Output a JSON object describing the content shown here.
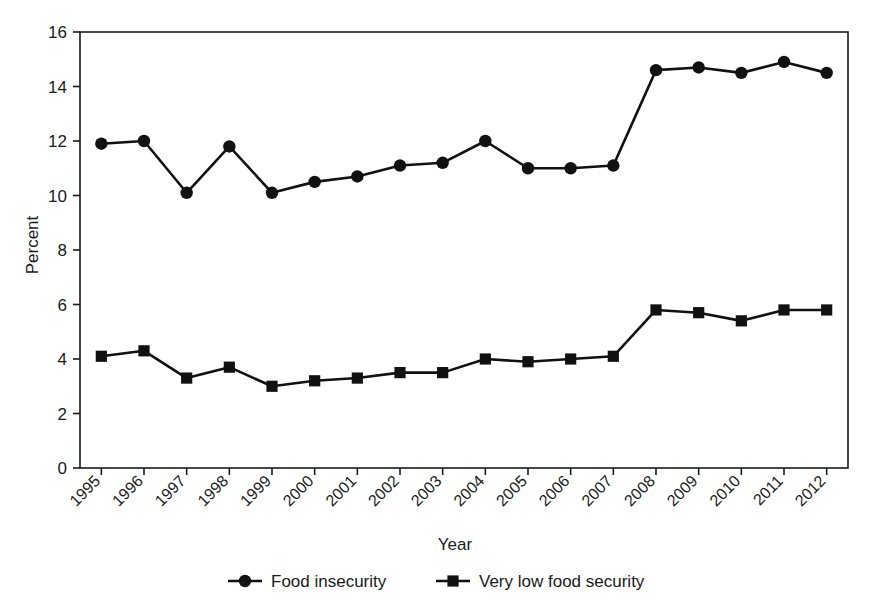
{
  "chart_data": {
    "type": "line",
    "title": "",
    "xlabel": "Year",
    "ylabel": "Percent",
    "categories": [
      "1995",
      "1996",
      "1997",
      "1998",
      "1999",
      "2000",
      "2001",
      "2002",
      "2003",
      "2004",
      "2005",
      "2006",
      "2007",
      "2008",
      "2009",
      "2010",
      "2011",
      "2012"
    ],
    "x": [
      1995,
      1996,
      1997,
      1998,
      1999,
      2000,
      2001,
      2002,
      2003,
      2004,
      2005,
      2006,
      2007,
      2008,
      2009,
      2010,
      2011,
      2012
    ],
    "series": [
      {
        "name": "Food insecurity",
        "marker": "circle",
        "color": "#111111",
        "values": [
          11.9,
          12.0,
          10.1,
          11.8,
          10.1,
          10.5,
          10.7,
          11.1,
          11.2,
          12.0,
          11.0,
          11.0,
          11.1,
          14.6,
          14.7,
          14.5,
          14.9,
          14.5
        ]
      },
      {
        "name": "Very low food security",
        "marker": "square",
        "color": "#111111",
        "values": [
          4.1,
          4.3,
          3.3,
          3.7,
          3.0,
          3.2,
          3.3,
          3.5,
          3.5,
          4.0,
          3.9,
          4.0,
          4.1,
          5.8,
          5.7,
          5.4,
          5.8,
          5.8
        ]
      }
    ],
    "ylim": [
      0,
      16
    ],
    "yticks": [
      0,
      2,
      4,
      6,
      8,
      10,
      12,
      14,
      16
    ],
    "ytick_labels": [
      "0",
      "2",
      "4",
      "6",
      "8",
      "10",
      "12",
      "14",
      "16"
    ],
    "xtick_rotation": 45,
    "grid": false,
    "legend_position": "bottom",
    "legend": [
      {
        "label": "Food insecurity",
        "marker": "circle"
      },
      {
        "label": "Very low food security",
        "marker": "square"
      }
    ]
  }
}
